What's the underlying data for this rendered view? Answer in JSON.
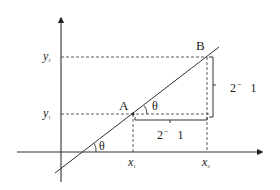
{
  "diagram": {
    "type": "coordinate-geometry",
    "colors": {
      "stroke": "#333333",
      "text": "#1a1a1a",
      "background": "#ffffff"
    },
    "points": {
      "A": {
        "label": "A",
        "x_label": "x",
        "x_sub": "1",
        "y_label": "y",
        "y_sub": "1"
      },
      "B": {
        "label": "B",
        "x_label": "x",
        "x_sub": "2",
        "y_label": "y",
        "y_sub": "2"
      }
    },
    "angles": {
      "at_axis": "θ",
      "at_A": "θ"
    },
    "segments": {
      "vertical_rise": {
        "main": "2",
        "sup": "−",
        "tail": "1"
      },
      "horizontal_run": {
        "main": "2",
        "sup": "−",
        "tail": "1"
      }
    }
  }
}
